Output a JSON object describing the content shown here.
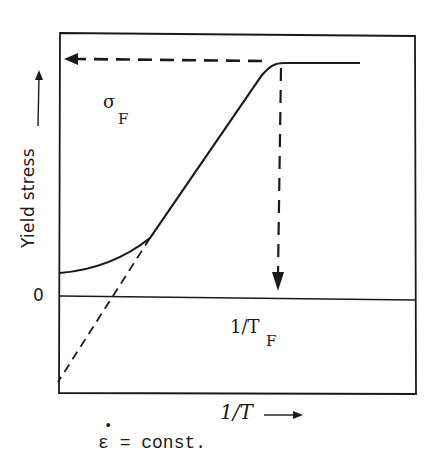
{
  "diagram": {
    "title": "",
    "y_axis": {
      "label": "Yield stress",
      "arrow": "up",
      "zero_label": "0"
    },
    "x_axis": {
      "label": "1/T",
      "arrow": "right"
    },
    "annotations": {
      "sigma_symbol": "σ",
      "sigma_subscript": "F",
      "tf_text": "1/T",
      "tf_subscript": "F",
      "strain_rate_symbol": "ε",
      "strain_rate_dot": "•",
      "strain_rate_text": "= const."
    },
    "elements": [
      {
        "id": "yield-curve",
        "kind": "solid-curve",
        "description": "yield stress rises from low value at left, linear mid-section, saturates at plateau"
      },
      {
        "id": "plateau",
        "kind": "solid-line",
        "description": "horizontal plateau at sigma_F"
      },
      {
        "id": "extrapolation",
        "kind": "dashed-line",
        "description": "linear extrapolation of curve down past zero line"
      },
      {
        "id": "sigma-f-arrow",
        "kind": "dashed-arrow",
        "direction": "left",
        "description": "points to sigma_F on stress axis"
      },
      {
        "id": "tf-arrow",
        "kind": "dashed-arrow",
        "direction": "down",
        "description": "points to 1/T_F on zero line"
      },
      {
        "id": "zero-line",
        "kind": "solid-line",
        "description": "horizontal zero-stress line"
      }
    ],
    "colors": {
      "ink": "#1a1a1a",
      "background": "#ffffff"
    }
  }
}
